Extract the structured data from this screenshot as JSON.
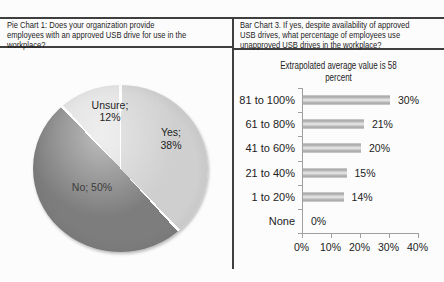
{
  "left_panel": {
    "title_lines": [
      "Pie Chart 1: Does your organization provide",
      "employees with an approved USB drive for use in the",
      "workplace?"
    ]
  },
  "right_panel": {
    "title_lines": [
      "Bar Chart 3. If yes, despite availability of approved",
      "USB drives, what percentage of employees use",
      "unapproved USB drives in the workplace?"
    ],
    "subtitle_lines": [
      "Extrapolated average value is 58",
      "percent"
    ]
  },
  "chart_data": [
    {
      "type": "pie",
      "title": "Pie Chart 1: Does your organization provide employees with an approved USB drive for use in the workplace?",
      "start_angle_deg": 0,
      "direction": "clockwise",
      "separator_color": "#ffffff",
      "slices": [
        {
          "name": "Yes",
          "value": 38,
          "color": "#cfcfcf",
          "label_lines": [
            "Yes;",
            "38%"
          ]
        },
        {
          "name": "No",
          "value": 50,
          "color": "#7d7d7d",
          "label_lines": [
            "No; 50%"
          ]
        },
        {
          "name": "Unsure",
          "value": 12,
          "color": "#dedede",
          "label_lines": [
            "Unsure;",
            "12%"
          ]
        }
      ]
    },
    {
      "type": "bar",
      "orientation": "horizontal",
      "title": "Extrapolated average value is 58 percent",
      "categories": [
        "81 to 100%",
        "61 to 80%",
        "41 to 60%",
        "21 to 40%",
        "1 to 20%",
        "None"
      ],
      "values": [
        30,
        21,
        20,
        15,
        14,
        0
      ],
      "value_labels": [
        "30%",
        "21%",
        "20%",
        "15%",
        "14%",
        "0%"
      ],
      "x_ticks": [
        "0%",
        "10%",
        "20%",
        "30%",
        "40%"
      ],
      "xlim": [
        0,
        40
      ],
      "grid": false,
      "legend": false,
      "bar_color": "#b5b5b5",
      "axis_color": "#a0a0a0"
    }
  ]
}
